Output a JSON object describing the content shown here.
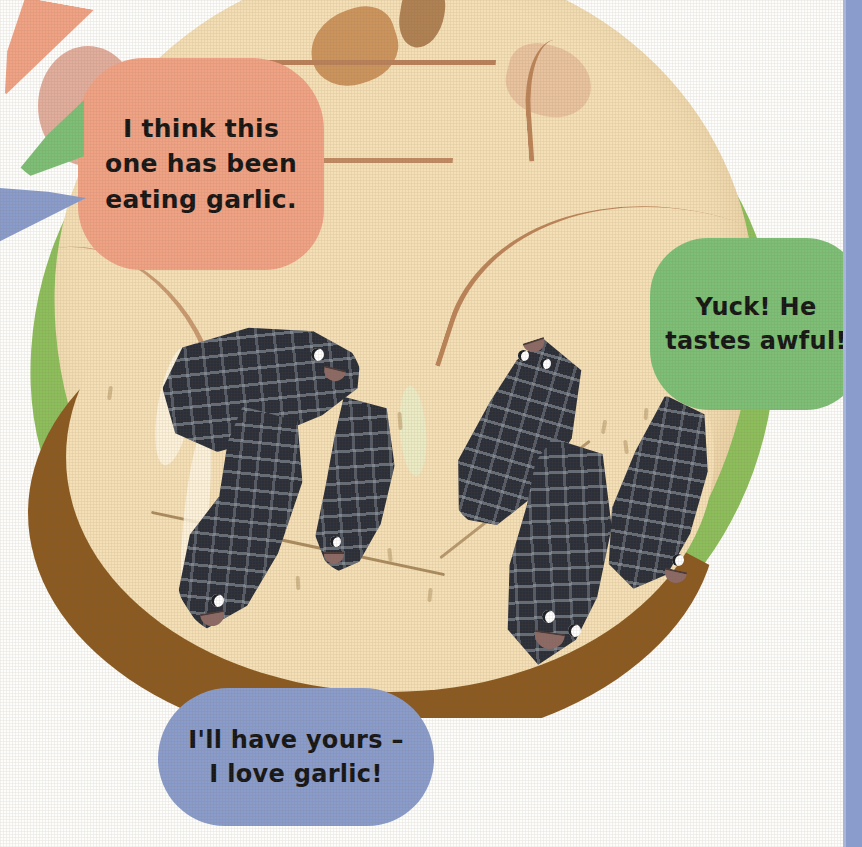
{
  "page": {
    "background_color": "#fdfdfb"
  },
  "edge_stripe": {
    "name": "page-edge-stripe",
    "color": "#8a9ccb"
  },
  "illustration": {
    "subject": "apple",
    "colors": {
      "flesh": "#f4dfb6",
      "skin_green": "#8dbe5c",
      "brown_band": "#8b5a21",
      "stem": "#b08153",
      "contour_line": "#b9815a"
    },
    "worm_color": "#2b2f39",
    "worm_texture_color": "#b9c3cd",
    "worm_eye_color": "#ffffff",
    "worm_mouth_color": "#8d6a66",
    "worm_count": 6
  },
  "speech_bubbles": [
    {
      "id": "bubble-garlic",
      "speaker": "worm-top-left",
      "color": "#f0a285",
      "text": "I think this\none has been\neating garlic."
    },
    {
      "id": "bubble-yuck",
      "speaker": "worm-center",
      "color": "#7dbf76",
      "text": "Yuck! He\ntastes awful!"
    },
    {
      "id": "bubble-love-garlic",
      "speaker": "worm-bottom",
      "color": "#8a9ccb",
      "text": "I'll have yours –\nI love garlic!"
    }
  ]
}
